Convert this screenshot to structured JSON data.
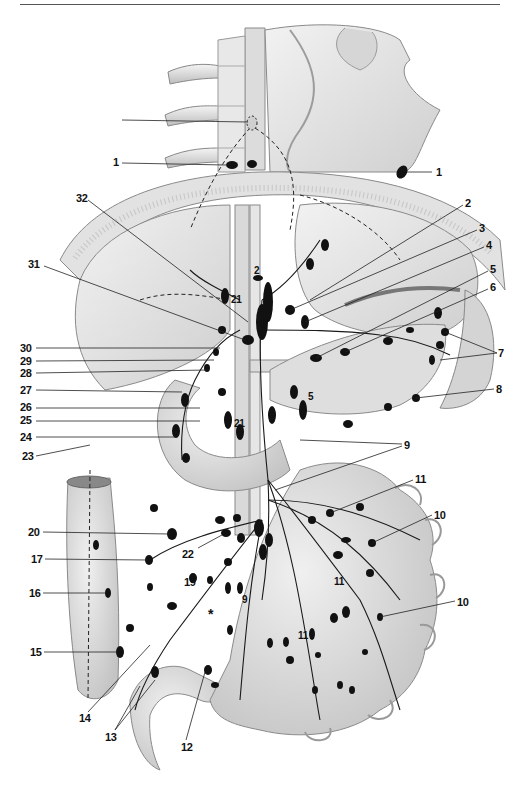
{
  "figure": {
    "asterisk_marker": "*",
    "callouts": [
      {
        "id": "1a",
        "text": "1",
        "x": 113,
        "y": 162,
        "side": "left"
      },
      {
        "id": "1b",
        "text": "1",
        "x": 436,
        "y": 172,
        "side": "right"
      },
      {
        "id": "2a",
        "text": "2",
        "x": 465,
        "y": 203,
        "side": "right"
      },
      {
        "id": "2b",
        "text": "2",
        "x": 254,
        "y": 268,
        "side": "inline"
      },
      {
        "id": "3",
        "text": "3",
        "x": 479,
        "y": 228,
        "side": "right"
      },
      {
        "id": "4",
        "text": "4",
        "x": 486,
        "y": 245,
        "side": "right"
      },
      {
        "id": "5a",
        "text": "5",
        "x": 490,
        "y": 269,
        "side": "right"
      },
      {
        "id": "5b",
        "text": "5",
        "x": 308,
        "y": 394,
        "side": "inline"
      },
      {
        "id": "6",
        "text": "6",
        "x": 490,
        "y": 287,
        "side": "right"
      },
      {
        "id": "7",
        "text": "7",
        "x": 498,
        "y": 350,
        "side": "right"
      },
      {
        "id": "8",
        "text": "8",
        "x": 496,
        "y": 386,
        "side": "right"
      },
      {
        "id": "9a",
        "text": "9",
        "x": 404,
        "y": 442,
        "side": "right"
      },
      {
        "id": "9b",
        "text": "9",
        "x": 242,
        "y": 594,
        "side": "inline"
      },
      {
        "id": "10a",
        "text": "10",
        "x": 434,
        "y": 511,
        "side": "right"
      },
      {
        "id": "10b",
        "text": "10",
        "x": 457,
        "y": 598,
        "side": "right"
      },
      {
        "id": "11a",
        "text": "11",
        "x": 415,
        "y": 476,
        "side": "right"
      },
      {
        "id": "11b",
        "text": "11",
        "x": 334,
        "y": 578,
        "side": "inline"
      },
      {
        "id": "11c",
        "text": "11",
        "x": 298,
        "y": 632,
        "side": "inline"
      },
      {
        "id": "12",
        "text": "12",
        "x": 181,
        "y": 743,
        "side": "bottom"
      },
      {
        "id": "13",
        "text": "13",
        "x": 107,
        "y": 733,
        "side": "bottom"
      },
      {
        "id": "14",
        "text": "14",
        "x": 81,
        "y": 714,
        "side": "bottom"
      },
      {
        "id": "15",
        "text": "15",
        "x": 32,
        "y": 648,
        "side": "left"
      },
      {
        "id": "16",
        "text": "16",
        "x": 31,
        "y": 589,
        "side": "left"
      },
      {
        "id": "17",
        "text": "17",
        "x": 33,
        "y": 555,
        "side": "left"
      },
      {
        "id": "18",
        "text": "18",
        "x": 184,
        "y": 578,
        "side": "inline"
      },
      {
        "id": "19",
        "text": "19",
        "x": 30,
        "y": 528,
        "side": "left"
      },
      {
        "id": "20",
        "text": "20",
        "x": 182,
        "y": 550,
        "side": "inline"
      },
      {
        "id": "21a",
        "text": "21",
        "x": 231,
        "y": 296,
        "side": "inline"
      },
      {
        "id": "21b",
        "text": "21",
        "x": 234,
        "y": 420,
        "side": "inline"
      },
      {
        "id": "22",
        "text": "22",
        "x": 22,
        "y": 452,
        "side": "left"
      },
      {
        "id": "23",
        "text": "23",
        "x": 22,
        "y": 433,
        "side": "left"
      },
      {
        "id": "24",
        "text": "24",
        "x": 22,
        "y": 417,
        "side": "left"
      },
      {
        "id": "25",
        "text": "25",
        "x": 22,
        "y": 404,
        "side": "left"
      },
      {
        "id": "26",
        "text": "26",
        "x": 22,
        "y": 386,
        "side": "left"
      },
      {
        "id": "27",
        "text": "27",
        "x": 22,
        "y": 369,
        "side": "left"
      },
      {
        "id": "28",
        "text": "28",
        "x": 22,
        "y": 357,
        "side": "left"
      },
      {
        "id": "29",
        "text": "29",
        "x": 22,
        "y": 344,
        "side": "left"
      },
      {
        "id": "30",
        "text": "30",
        "x": 28,
        "y": 261,
        "side": "left"
      },
      {
        "id": "31",
        "text": "31",
        "x": 76,
        "y": 195,
        "side": "left"
      },
      {
        "id": "32",
        "text": "32",
        "x": 106,
        "y": 114,
        "side": "left"
      }
    ]
  },
  "colors": {
    "background": "#ffffff",
    "organ_fill": "#e6e6e6",
    "organ_shade": "#c8c8c8",
    "organ_outline": "#8a8a8a",
    "node_fill": "#111111",
    "vessel": "#1a1a1a",
    "leader_line": "#222222",
    "label_text": "#111111"
  }
}
